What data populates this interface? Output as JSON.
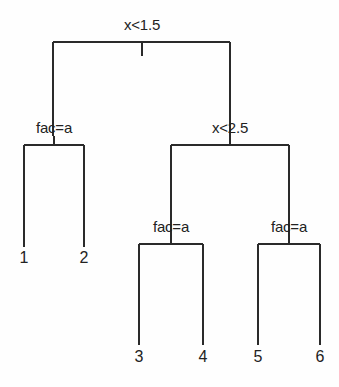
{
  "figure": {
    "kind": "decision-tree-diagram",
    "background_color": "#fefefe",
    "line_color": "#2a2a2a",
    "text_color": "#222222",
    "width": 339,
    "height": 387
  },
  "tree": {
    "split_labels": [
      {
        "id": "root",
        "text": "x<1.5",
        "x": 142,
        "y": 16
      },
      {
        "id": "left-inner",
        "text": "fac=a",
        "x": 54,
        "y": 119
      },
      {
        "id": "right-inner",
        "text": "x<2.5",
        "x": 230,
        "y": 119
      },
      {
        "id": "mid-left",
        "text": "fac=a",
        "x": 171,
        "y": 218
      },
      {
        "id": "mid-right",
        "text": "fac=a",
        "x": 289,
        "y": 218
      }
    ],
    "leaf_labels": [
      {
        "id": "leaf-1",
        "text": "1",
        "x": 24,
        "y": 249
      },
      {
        "id": "leaf-2",
        "text": "2",
        "x": 84,
        "y": 249
      },
      {
        "id": "leaf-3",
        "text": "3",
        "x": 139,
        "y": 348
      },
      {
        "id": "leaf-4",
        "text": "4",
        "x": 203,
        "y": 348
      },
      {
        "id": "leaf-5",
        "text": "5",
        "x": 258,
        "y": 348
      },
      {
        "id": "leaf-6",
        "text": "6",
        "x": 320,
        "y": 348
      }
    ],
    "edges": [
      {
        "id": "root-bar",
        "type": "hline",
        "x1": 53,
        "x2": 230,
        "y": 42
      },
      {
        "id": "root-stub",
        "type": "vline",
        "x": 142,
        "y1": 42,
        "y2": 56
      },
      {
        "id": "root-left-drop",
        "type": "vline",
        "x": 53,
        "y1": 42,
        "y2": 136
      },
      {
        "id": "root-right-drop",
        "type": "vline",
        "x": 230,
        "y1": 42,
        "y2": 136
      },
      {
        "id": "left-bar",
        "type": "hline",
        "x1": 24,
        "x2": 84,
        "y": 145
      },
      {
        "id": "left-stub",
        "type": "vline",
        "x": 54,
        "y1": 136,
        "y2": 145
      },
      {
        "id": "left-leaf1-drop",
        "type": "vline",
        "x": 24,
        "y1": 145,
        "y2": 247
      },
      {
        "id": "left-leaf2-drop",
        "type": "vline",
        "x": 84,
        "y1": 145,
        "y2": 247
      },
      {
        "id": "right-bar",
        "type": "hline",
        "x1": 171,
        "x2": 289,
        "y": 145
      },
      {
        "id": "right-stub",
        "type": "vline",
        "x": 230,
        "y1": 136,
        "y2": 145
      },
      {
        "id": "right-left-drop",
        "type": "vline",
        "x": 171,
        "y1": 145,
        "y2": 235
      },
      {
        "id": "right-right-drop",
        "type": "vline",
        "x": 289,
        "y1": 145,
        "y2": 235
      },
      {
        "id": "midleft-bar",
        "type": "hline",
        "x1": 139,
        "x2": 203,
        "y": 244
      },
      {
        "id": "midleft-stub",
        "type": "vline",
        "x": 171,
        "y1": 235,
        "y2": 244
      },
      {
        "id": "leaf3-drop",
        "type": "vline",
        "x": 139,
        "y1": 244,
        "y2": 345
      },
      {
        "id": "leaf4-drop",
        "type": "vline",
        "x": 203,
        "y1": 244,
        "y2": 345
      },
      {
        "id": "midright-bar",
        "type": "hline",
        "x1": 258,
        "x2": 320,
        "y": 244
      },
      {
        "id": "midright-stub",
        "type": "vline",
        "x": 289,
        "y1": 235,
        "y2": 244
      },
      {
        "id": "leaf5-drop",
        "type": "vline",
        "x": 258,
        "y1": 244,
        "y2": 345
      },
      {
        "id": "leaf6-drop",
        "type": "vline",
        "x": 320,
        "y1": 244,
        "y2": 345
      }
    ]
  },
  "chart_data": {
    "type": "tree",
    "title": "",
    "root": {
      "label": "x<1.5",
      "children": [
        {
          "label": "fac=a",
          "children": [
            {
              "label": "1",
              "leaf": true
            },
            {
              "label": "2",
              "leaf": true
            }
          ]
        },
        {
          "label": "x<2.5",
          "children": [
            {
              "label": "fac=a",
              "children": [
                {
                  "label": "3",
                  "leaf": true
                },
                {
                  "label": "4",
                  "leaf": true
                }
              ]
            },
            {
              "label": "fac=a",
              "children": [
                {
                  "label": "5",
                  "leaf": true
                },
                {
                  "label": "6",
                  "leaf": true
                }
              ]
            }
          ]
        }
      ]
    },
    "split_conditions": [
      "x<1.5",
      "fac=a",
      "x<2.5",
      "fac=a",
      "fac=a"
    ],
    "leaves": [
      "1",
      "2",
      "3",
      "4",
      "5",
      "6"
    ],
    "depth": 4,
    "leaf_count": 6,
    "internal_node_count": 5
  }
}
